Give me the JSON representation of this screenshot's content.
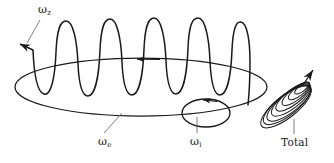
{
  "figure": {
    "background_color": "#ffffff",
    "stroke_color": "#1a1a1a",
    "labels": {
      "omega_z": {
        "symbol": "ω",
        "subscript": "z",
        "text": "ωz"
      },
      "omega_precession": {
        "symbol": "ω",
        "subscript": "e",
        "text": "ωe"
      },
      "omega_spin": {
        "symbol": "ω",
        "subscript": "i",
        "text": "ωi"
      },
      "total": {
        "text": "Total"
      }
    },
    "elements": {
      "precession_ellipse": {
        "name": "large-ellipse",
        "center_x": 141,
        "center_y": 87,
        "radius_x": 126,
        "radius_y": 29,
        "direction_arrow": "left"
      },
      "helix": {
        "name": "helix-coil",
        "turns": 11,
        "amplitude": 56,
        "start_arrow": "left"
      },
      "spin_circle": {
        "name": "small-ellipse",
        "center_x": 206,
        "center_y": 113,
        "radius_x": 24,
        "radius_y": 14,
        "direction_arrow": "counterclockwise"
      },
      "total_spiral": {
        "name": "total-spiral-cone",
        "loops": 8,
        "tip_arrow": "up-right"
      }
    }
  }
}
